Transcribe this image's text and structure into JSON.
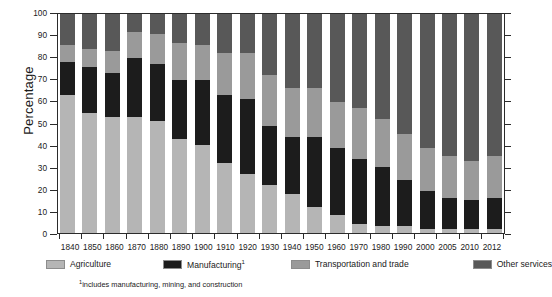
{
  "chart_data": {
    "type": "bar",
    "subtype": "stacked-bar-100-percent",
    "title": "",
    "xlabel": "",
    "ylabel": "Percentage",
    "ylim": [
      0,
      100
    ],
    "yticks": [
      0,
      10,
      20,
      30,
      40,
      50,
      60,
      70,
      80,
      90,
      100
    ],
    "grid": false,
    "legend_position": "bottom",
    "stack_order": "bottom-to-top",
    "categories": [
      "1840",
      "1850",
      "1860",
      "1870",
      "1880",
      "1890",
      "1900",
      "1910",
      "1920",
      "1930",
      "1940",
      "1950",
      "1960",
      "1970",
      "1980",
      "1990",
      "2000",
      "2005",
      "2010",
      "2012"
    ],
    "series": [
      {
        "name": "Agriculture",
        "color": "#b5b5b5",
        "values": [
          63,
          55,
          53,
          53,
          51,
          43,
          40,
          32,
          27,
          22,
          18,
          12,
          8,
          4,
          3,
          3,
          2,
          2,
          2,
          2
        ]
      },
      {
        "name": "Manufacturing",
        "color": "#1c1c1c",
        "values": [
          15,
          21,
          20,
          27,
          26,
          27,
          30,
          31,
          34,
          27,
          26,
          32,
          31,
          30,
          27,
          21,
          17,
          14,
          13,
          14
        ]
      },
      {
        "name": "Transportation and trade",
        "color": "#9a9a9a",
        "values": [
          8,
          8,
          10,
          12,
          14,
          17,
          16,
          19,
          21,
          23,
          22,
          22,
          21,
          23,
          22,
          21,
          20,
          19,
          18,
          19
        ]
      },
      {
        "name": "Other services",
        "color": "#585858",
        "values": [
          14,
          16,
          17,
          8,
          9,
          13,
          14,
          18,
          18,
          28,
          34,
          34,
          40,
          43,
          48,
          55,
          61,
          65,
          67,
          65
        ]
      }
    ],
    "legend_labels": [
      "Agriculture",
      "Manufacturing",
      "Transportation and trade",
      "Other services"
    ],
    "legend_superscripts": [
      "",
      "1",
      "",
      ""
    ],
    "footnote_marker": "1",
    "footnote_text": "includes manufacturing, mining, and construction"
  }
}
